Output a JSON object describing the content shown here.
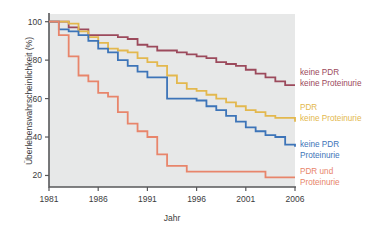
{
  "chart_data": {
    "type": "line",
    "subtype": "step-kaplan-meier",
    "title": "",
    "xlabel": "Jahr",
    "ylabel": "Überlebenswahrscheinlichkeit (%)",
    "xlim": [
      1981,
      2006
    ],
    "ylim": [
      14,
      104
    ],
    "xticks": [
      1981,
      1986,
      1991,
      1996,
      2001,
      2006
    ],
    "yticks": [
      20,
      40,
      60,
      80,
      100
    ],
    "grid": false,
    "legend_position": "right",
    "background": "#e7e8e8",
    "series": [
      {
        "name": "keine PDR keine Proteinurie",
        "label_line1": "keine PDR",
        "label_line2": "keine Proteinurie",
        "color": "#9c4a5c",
        "x": [
          1981,
          1982,
          1983,
          1984,
          1985,
          1986,
          1987,
          1988,
          1989,
          1990,
          1991,
          1992,
          1993,
          1994,
          1995,
          1996,
          1997,
          1998,
          1999,
          2000,
          2001,
          2002,
          2003,
          2004,
          2005,
          2006
        ],
        "y": [
          100,
          100,
          97,
          96,
          93,
          93,
          93,
          92,
          91,
          88,
          87,
          85,
          85,
          84,
          83,
          82,
          81,
          79,
          78,
          77,
          75,
          73,
          71,
          69,
          67,
          67
        ]
      },
      {
        "name": "PDR keine Proteinurie",
        "label_line1": "PDR",
        "label_line2": "keine Proteinurie",
        "color": "#e3b84e",
        "x": [
          1981,
          1982,
          1983,
          1984,
          1985,
          1986,
          1987,
          1988,
          1989,
          1990,
          1991,
          1992,
          1993,
          1994,
          1995,
          1996,
          1997,
          1998,
          1999,
          2000,
          2001,
          2002,
          2003,
          2004,
          2005,
          2006
        ],
        "y": [
          100,
          100,
          99,
          95,
          92,
          89,
          86,
          85,
          84,
          81,
          79,
          77,
          72,
          68,
          65,
          64,
          62,
          60,
          58,
          56,
          54,
          53,
          51,
          50,
          50,
          48
        ]
      },
      {
        "name": "keine PDR Proteinurie",
        "label_line1": "keine PDR",
        "label_line2": "Proteinurie",
        "color": "#3d74b8",
        "x": [
          1981,
          1982,
          1983,
          1984,
          1985,
          1986,
          1987,
          1988,
          1989,
          1990,
          1991,
          1992,
          1993,
          1994,
          1995,
          1996,
          1997,
          1998,
          1999,
          2000,
          2001,
          2002,
          2003,
          2004,
          2005,
          2006
        ],
        "y": [
          100,
          96,
          95,
          93,
          90,
          86,
          84,
          80,
          77,
          74,
          71,
          71,
          60,
          60,
          60,
          59,
          56,
          54,
          51,
          48,
          45,
          43,
          41,
          40,
          36,
          35
        ]
      },
      {
        "name": "PDR und Proteinurie",
        "label_line1": "PDR und",
        "label_line2": "Proteinurie",
        "color": "#e8856b",
        "x": [
          1981,
          1982,
          1983,
          1984,
          1985,
          1986,
          1987,
          1988,
          1989,
          1990,
          1991,
          1992,
          1993,
          1994,
          1995,
          1996,
          1997,
          1998,
          1999,
          2000,
          2001,
          2002,
          2003,
          2004,
          2005,
          2006
        ],
        "y": [
          100,
          93,
          82,
          72,
          69,
          63,
          61,
          53,
          47,
          43,
          40,
          31,
          25,
          25,
          22,
          22,
          22,
          22,
          22,
          22,
          22,
          22,
          19,
          19,
          19,
          19
        ]
      }
    ]
  },
  "axes": {
    "x_title": "Jahr",
    "y_title": "Überlebenswahrscheinlichkeit (%)",
    "x_tick_labels": [
      "1981",
      "1986",
      "1991",
      "1996",
      "2001",
      "2006"
    ],
    "y_tick_labels": [
      "100",
      "80",
      "60",
      "40",
      "20"
    ]
  },
  "legend": {
    "entries": [
      {
        "line1": "keine PDR",
        "line2": "keine Proteinurie",
        "color": "#9c4a5c"
      },
      {
        "line1": "PDR",
        "line2": "keine Proteinurie",
        "color": "#e3b84e"
      },
      {
        "line1": "keine PDR",
        "line2": "Proteinurie",
        "color": "#3d74b8"
      },
      {
        "line1": "PDR und",
        "line2": "Proteinurie",
        "color": "#e8856b"
      }
    ]
  }
}
